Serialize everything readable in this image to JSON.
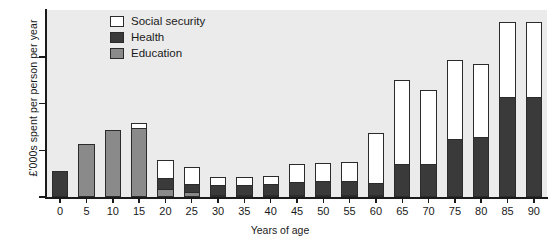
{
  "chart_data": {
    "type": "bar",
    "stacked": true,
    "title": "",
    "xlabel": "Years of age",
    "ylabel": "£'000s spent per person per year",
    "categories": [
      "0",
      "5",
      "10",
      "15",
      "20",
      "25",
      "30",
      "35",
      "40",
      "45",
      "50",
      "55",
      "60",
      "65",
      "70",
      "75",
      "80",
      "85",
      "90"
    ],
    "series": [
      {
        "name": "Education",
        "color": "#8a8a8a",
        "values": [
          0.0,
          2.25,
          2.85,
          2.95,
          0.35,
          0.2,
          0.1,
          0.05,
          0.05,
          0.05,
          0.05,
          0.05,
          0.05,
          0.0,
          0.0,
          0.0,
          0.0,
          0.0,
          0.0
        ]
      },
      {
        "name": "Health",
        "color": "#3a3a3a",
        "values": [
          1.1,
          0.0,
          0.0,
          0.0,
          0.5,
          0.4,
          0.45,
          0.45,
          0.5,
          0.6,
          0.65,
          0.65,
          0.55,
          1.4,
          1.4,
          2.5,
          2.55,
          4.3,
          4.3
        ]
      },
      {
        "name": "Social security",
        "color": "#ffffff",
        "values": [
          0.0,
          0.0,
          0.0,
          0.25,
          0.8,
          0.75,
          0.4,
          0.4,
          0.4,
          0.8,
          0.8,
          0.85,
          2.2,
          3.65,
          3.2,
          3.4,
          3.2,
          3.25,
          3.25
        ]
      }
    ],
    "ylim": [
      0,
      8
    ],
    "yticks": [
      0,
      2,
      4,
      6
    ],
    "ytick_labels": [
      "0",
      "2",
      "4",
      "6"
    ],
    "totals": [
      1.1,
      2.25,
      2.85,
      3.2,
      1.65,
      1.35,
      0.95,
      0.9,
      0.95,
      1.45,
      1.5,
      1.55,
      2.8,
      5.05,
      4.6,
      5.9,
      5.75,
      7.55,
      7.55
    ],
    "grid": false,
    "legend_position": "top-left-inside"
  },
  "legend": {
    "items": [
      {
        "label": "Social security",
        "color": "#ffffff"
      },
      {
        "label": "Health",
        "color": "#3a3a3a"
      },
      {
        "label": "Education",
        "color": "#8a8a8a"
      }
    ]
  }
}
